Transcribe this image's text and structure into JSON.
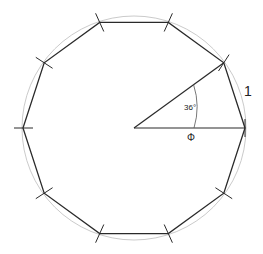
{
  "diagram": {
    "title": "",
    "shape": "regular decagon inscribed in circle",
    "sides": 10,
    "center": [
      134,
      128
    ],
    "radius": 111,
    "colors": {
      "polygon": "#2a2a2a",
      "circle": "#b8b8b8",
      "ticks": "#2a2a2a",
      "text": "#222222"
    },
    "labels": {
      "angle": "36°",
      "radius_symbol": "Φ",
      "side_length": "1"
    }
  }
}
